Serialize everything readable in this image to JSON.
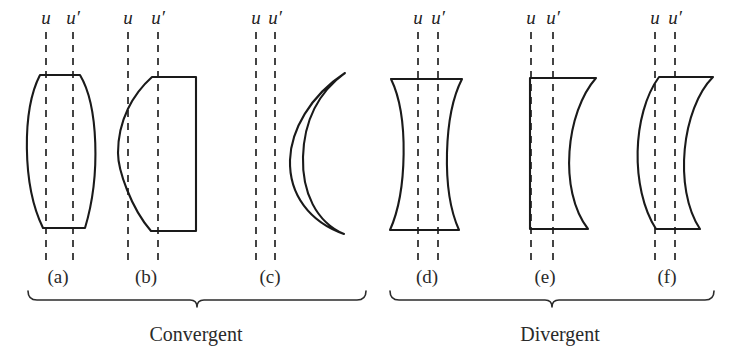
{
  "figure": {
    "background_color": "#ffffff",
    "ink_color": "#1a1a1a",
    "width": 734,
    "height": 349
  },
  "axis_label_symbols": {
    "object_axis": "u",
    "image_axis": "u′"
  },
  "groups": [
    {
      "id": "convergent",
      "caption": "Convergent",
      "caption_x": 196,
      "caption_y": 341,
      "brace_left": 28,
      "brace_right": 366,
      "brace_y": 300,
      "brace_tip_x": 197,
      "panel_ids": [
        "a",
        "b",
        "c"
      ]
    },
    {
      "id": "divergent",
      "caption": "Divergent",
      "caption_x": 560,
      "caption_y": 341,
      "brace_left": 390,
      "brace_right": 714,
      "brace_y": 300,
      "brace_tip_x": 552,
      "panel_ids": [
        "d",
        "e",
        "f"
      ]
    }
  ],
  "panels": [
    {
      "id": "a",
      "label": "(a)",
      "lens_kind": "biconvex",
      "label_x": 58,
      "label_y": 283,
      "u_label_x": 46,
      "u_prime_label_x": 73,
      "u_label_y": 24,
      "dash_lines": [
        {
          "name": "u",
          "x": 46,
          "y1": 32,
          "y2": 263
        },
        {
          "name": "u-prime",
          "x": 73,
          "y1": 32,
          "y2": 263
        }
      ],
      "outline_path": "M 40 75 L 80 75 C 98 105 101 175 85 228 L 43 228 C 22 185 22 110 40 75 Z"
    },
    {
      "id": "b",
      "label": "(b)",
      "lens_kind": "plano-convex",
      "label_x": 146,
      "label_y": 283,
      "u_label_x": 128,
      "u_prime_label_x": 158,
      "u_label_y": 24,
      "dash_lines": [
        {
          "name": "u",
          "x": 128,
          "y1": 32,
          "y2": 263
        },
        {
          "name": "u-prime",
          "x": 158,
          "y1": 32,
          "y2": 263
        }
      ],
      "outline_path": "M 152 77 L 196 77 L 196 231 L 151 231 C 131 208 118 170 118 153 C 118 120 133 94 152 77 Z"
    },
    {
      "id": "c",
      "label": "(c)",
      "lens_kind": "positive-meniscus",
      "label_x": 270,
      "label_y": 283,
      "u_label_x": 256,
      "u_prime_label_x": 275,
      "u_label_y": 24,
      "dash_lines": [
        {
          "name": "u",
          "x": 256,
          "y1": 32,
          "y2": 263
        },
        {
          "name": "u-prime",
          "x": 275,
          "y1": 32,
          "y2": 263
        }
      ],
      "outline_path": "M 345 73 C 310 96 291 130 290 160 C 289 195 310 222 344 234 C 316 222 302 192 303 157 C 304 120 319 92 345 73 Z"
    },
    {
      "id": "d",
      "label": "(d)",
      "lens_kind": "biconcave",
      "label_x": 427,
      "label_y": 283,
      "u_label_x": 418,
      "u_prime_label_x": 438,
      "u_label_y": 24,
      "dash_lines": [
        {
          "name": "u",
          "x": 418,
          "y1": 32,
          "y2": 263
        },
        {
          "name": "u-prime",
          "x": 438,
          "y1": 32,
          "y2": 263
        }
      ],
      "outline_path": "M 391 79 L 462 79 C 444 114 441 190 459 230 L 390 230 C 407 192 409 116 391 79 Z"
    },
    {
      "id": "e",
      "label": "(e)",
      "lens_kind": "plano-concave",
      "label_x": 545,
      "label_y": 283,
      "u_label_x": 531,
      "u_prime_label_x": 553,
      "u_label_y": 24,
      "dash_lines": [
        {
          "name": "u",
          "x": 531,
          "y1": 32,
          "y2": 263
        },
        {
          "name": "u-prime",
          "x": 553,
          "y1": 32,
          "y2": 263
        }
      ],
      "outline_path": "M 530 78 L 596 78 C 566 112 558 190 588 229 L 530 229 Z"
    },
    {
      "id": "f",
      "label": "(f)",
      "lens_kind": "negative-meniscus",
      "label_x": 667,
      "label_y": 283,
      "u_label_x": 655,
      "u_prime_label_x": 675,
      "u_label_y": 24,
      "dash_lines": [
        {
          "name": "u",
          "x": 655,
          "y1": 32,
          "y2": 263
        },
        {
          "name": "u-prime",
          "x": 675,
          "y1": 32,
          "y2": 263
        }
      ],
      "outline_path": "M 659 77 L 713 77 C 682 108 673 188 700 229 L 656 229 C 630 188 632 114 659 77 Z"
    }
  ]
}
